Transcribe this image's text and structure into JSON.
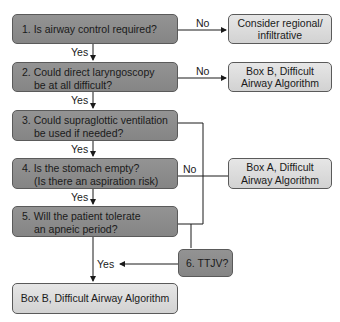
{
  "nodes": {
    "q1": {
      "text": "1. Is airway control required?"
    },
    "q2": {
      "line1": "2. Could direct laryngoscopy",
      "line2": "be at all difficult?"
    },
    "q3": {
      "line1": "3. Could supraglottic ventilation",
      "line2": "be used if needed?"
    },
    "q4": {
      "line1": "4. Is the stomach empty?",
      "line2": "(Is there an aspiration risk)"
    },
    "q5": {
      "line1": "5. Will the patient tolerate",
      "line2": "an apneic period?"
    },
    "q6": {
      "text": "6. TTJV?"
    },
    "regional": {
      "line1": "Consider regional/",
      "line2": "infiltrative"
    },
    "boxB_right": {
      "line1": "Box B, Difficult",
      "line2": "Airway Algorithm"
    },
    "boxA": {
      "line1": "Box A, Difficult",
      "line2": "Airway Algorithm"
    },
    "boxB_bottom": {
      "text": "Box B, Difficult Airway Algorithm"
    }
  },
  "edge_labels": {
    "q1_no": "No",
    "q1_yes": "Yes",
    "q2_no": "No",
    "q2_yes": "Yes",
    "q3_yes": "Yes",
    "q4_no": "No",
    "q4_yes": "Yes",
    "q6_yes": "Yes"
  },
  "colors": {
    "question_fill": "#8a8a8a",
    "outcome_fill": "#dcdcdc",
    "line": "#1a1a1a"
  }
}
